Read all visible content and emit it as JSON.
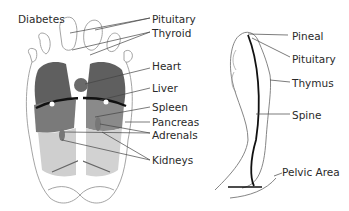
{
  "figure": {
    "left": {
      "title_label": "Diabetes",
      "labels": [
        "Pituitary",
        "Thyroid",
        "Heart",
        "Liver",
        "Spleen",
        "Pancreas",
        "Adrenals",
        "Kidneys"
      ]
    },
    "right": {
      "labels": [
        "Pineal",
        "Pituitary",
        "Thymus",
        "Spine",
        "Pelvic Area"
      ]
    }
  },
  "colors": {
    "outline": "#9a9a9a",
    "dark_region": "#5f5f5f",
    "mid_region": "#8a8a8a",
    "light_region": "#c8c8c8",
    "diaphragm": "#111111",
    "leader": "#444444"
  }
}
